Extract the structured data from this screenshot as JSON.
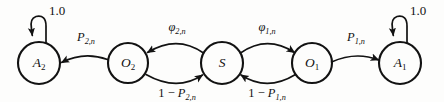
{
  "figure": {
    "type": "state-transition-diagram",
    "title": "",
    "background_color": "#fdfdfc",
    "stroke_color": "#121212",
    "width": 444,
    "height": 102
  },
  "nodes": [
    {
      "id": "A2",
      "base": "A",
      "sub": "2",
      "cx": 39,
      "cy": 63,
      "r": 21
    },
    {
      "id": "O2",
      "base": "O",
      "sub": "2",
      "cx": 128,
      "cy": 63,
      "r": 20
    },
    {
      "id": "S",
      "base": "S",
      "sub": "",
      "cx": 222,
      "cy": 63,
      "r": 21
    },
    {
      "id": "O1",
      "base": "O",
      "sub": "1",
      "cx": 312,
      "cy": 63,
      "r": 20
    },
    {
      "id": "A1",
      "base": "A",
      "sub": "1",
      "cx": 400,
      "cy": 63,
      "r": 21
    }
  ],
  "edges": [
    {
      "id": "O2-to-A2",
      "from": "O2",
      "to": "A2",
      "label_base": "P",
      "label_sub": "2,n",
      "label_prefix": "",
      "label_x": 86,
      "label_y": 41
    },
    {
      "id": "S-to-O2",
      "from": "S",
      "to": "O2",
      "label_base": "φ",
      "label_sub": "2,n",
      "label_prefix": "",
      "label_x": 177,
      "label_y": 31
    },
    {
      "id": "O2-to-S",
      "from": "O2",
      "to": "S",
      "label_base": "P",
      "label_sub": "2,n",
      "label_prefix": "1 − ",
      "label_x": 177,
      "label_y": 97
    },
    {
      "id": "S-to-O1",
      "from": "S",
      "to": "O1",
      "label_base": "φ",
      "label_sub": "1,n",
      "label_prefix": "",
      "label_x": 267,
      "label_y": 31
    },
    {
      "id": "O1-to-S",
      "from": "O1",
      "to": "S",
      "label_base": "P",
      "label_sub": "1,n",
      "label_prefix": "1 − ",
      "label_x": 267,
      "label_y": 97
    },
    {
      "id": "O1-to-A1",
      "from": "O1",
      "to": "A1",
      "label_base": "P",
      "label_sub": "1,n",
      "label_prefix": "",
      "label_x": 356,
      "label_y": 41
    }
  ],
  "self_loops": [
    {
      "id": "A2-self-loop",
      "node": "A2",
      "label": "1.0",
      "label_x": 57,
      "label_y": 15
    },
    {
      "id": "A1-self-loop",
      "node": "A1",
      "label": "1.0",
      "label_x": 418,
      "label_y": 15
    }
  ]
}
